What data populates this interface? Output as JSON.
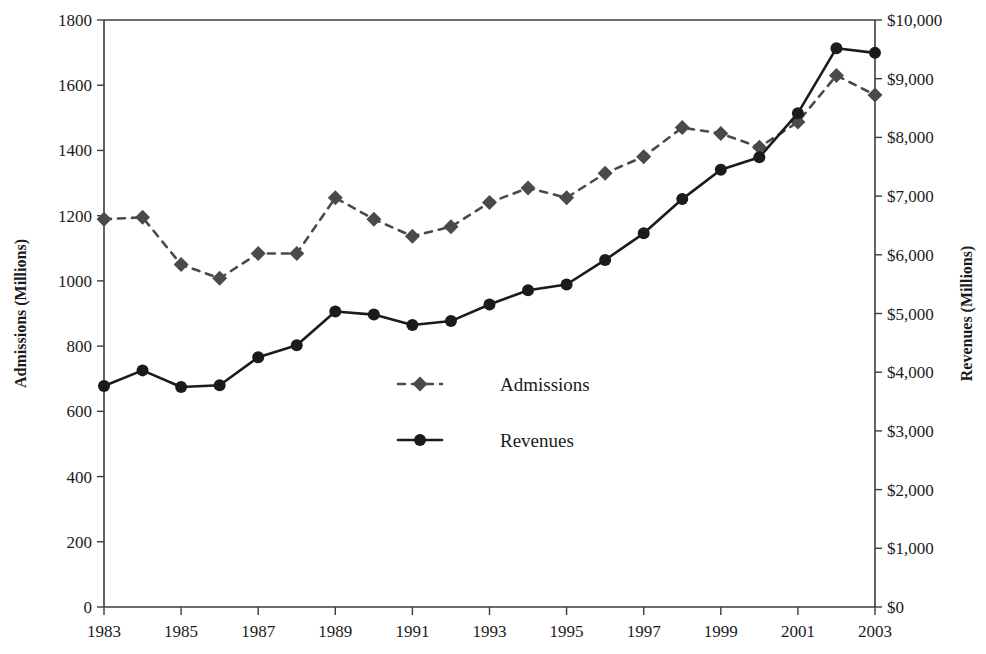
{
  "chart_data": {
    "type": "line",
    "title": "",
    "xlabel": "",
    "x": [
      1983,
      1984,
      1985,
      1986,
      1987,
      1988,
      1989,
      1990,
      1991,
      1992,
      1993,
      1994,
      1995,
      1996,
      1997,
      1998,
      1999,
      2000,
      2001,
      2002,
      2003
    ],
    "x_tick_labels": [
      "1983",
      "1985",
      "1987",
      "1989",
      "1991",
      "1993",
      "1995",
      "1997",
      "1999",
      "2001",
      "2003"
    ],
    "x_ticks": [
      1983,
      1985,
      1987,
      1989,
      1991,
      1993,
      1995,
      1997,
      1999,
      2001,
      2003
    ],
    "grid": false,
    "legend_position": "center",
    "series": [
      {
        "name": "Admissions",
        "axis": "left",
        "marker": "diamond",
        "line_style": "dashed",
        "color": "#4a4a4a",
        "units": "Millions",
        "values": [
          1189,
          1195,
          1050,
          1008,
          1084,
          1084,
          1255,
          1189,
          1137,
          1166,
          1240,
          1285,
          1255,
          1330,
          1381,
          1470,
          1452,
          1410,
          1487,
          1630,
          1570
        ]
      },
      {
        "name": "Revenues",
        "axis": "right",
        "marker": "circle",
        "line_style": "solid",
        "color": "#1b1b1b",
        "units": "Millions",
        "values": [
          3766,
          4031,
          3749,
          3778,
          4253,
          4458,
          5033,
          4981,
          4803,
          4871,
          5154,
          5396,
          5494,
          5912,
          6366,
          6949,
          7448,
          7661,
          8413,
          9520,
          9440
        ]
      }
    ],
    "left_axis": {
      "label": "Admissions (Millions)",
      "ylim": [
        0,
        1800
      ],
      "tick_labels": [
        "1800",
        "1600",
        "1400",
        "1200",
        "1000",
        "800",
        "600",
        "400",
        "200",
        "0"
      ],
      "tick_values": [
        1800,
        1600,
        1400,
        1200,
        1000,
        800,
        600,
        400,
        200,
        0
      ]
    },
    "right_axis": {
      "label": "Revenues (Millions)",
      "ylim": [
        0,
        10000
      ],
      "tick_labels": [
        "$10,000",
        "$9,000",
        "$8,000",
        "$7,000",
        "$6,000",
        "$5,000",
        "$4,000",
        "$3,000",
        "$2,000",
        "$1,000",
        "$0"
      ],
      "tick_values": [
        10000,
        9000,
        8000,
        7000,
        6000,
        5000,
        4000,
        3000,
        2000,
        1000,
        0
      ]
    },
    "legend": [
      {
        "label": "Admissions",
        "marker": "diamond",
        "line_style": "dashed"
      },
      {
        "label": "Revenues",
        "marker": "circle",
        "line_style": "solid"
      }
    ]
  },
  "colors": {
    "admissions": "#4a4a4a",
    "revenues": "#1b1b1b",
    "axis": "#3c3c3c",
    "background": "#ffffff"
  }
}
